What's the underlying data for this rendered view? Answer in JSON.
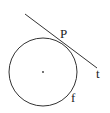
{
  "diagram": {
    "circle": {
      "cx": 43,
      "cy": 72,
      "r": 34,
      "stroke": "#333333"
    },
    "center_dot": {
      "cx": 43,
      "cy": 72,
      "r": 0.9
    },
    "tangent": {
      "x1": 25,
      "y1": 14,
      "x2": 97,
      "y2": 68,
      "stroke": "#333333"
    },
    "tangent_point": {
      "x": 61,
      "y": 41
    },
    "labels": {
      "point": "P",
      "tangent_line": "t",
      "circle": "f"
    }
  }
}
